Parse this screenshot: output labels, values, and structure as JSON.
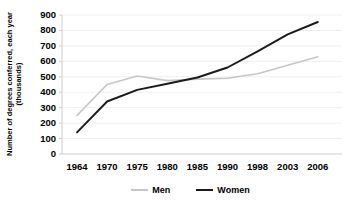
{
  "figure": {
    "width": 349,
    "height": 201,
    "background": "#ffffff"
  },
  "chart_data": {
    "type": "line",
    "title": "",
    "ylabel_line1": "Number of degrees conferred, each year",
    "ylabel_line2": "(thousands)",
    "xlabel": "",
    "categories": [
      "1964",
      "1970",
      "1975",
      "1980",
      "1985",
      "1990",
      "1998",
      "2003",
      "2006"
    ],
    "series": [
      {
        "name": "Men",
        "color": "#c6c6c6",
        "stroke_width": 1.6,
        "values": [
          250,
          450,
          505,
          475,
          485,
          490,
          520,
          575,
          630
        ]
      },
      {
        "name": "Women",
        "color": "#1a1a1a",
        "stroke_width": 1.9,
        "values": [
          140,
          340,
          415,
          455,
          495,
          560,
          665,
          775,
          855
        ]
      }
    ],
    "ylim": [
      0,
      900
    ],
    "yticks": [
      0,
      100,
      200,
      300,
      400,
      500,
      600,
      700,
      800,
      900
    ],
    "grid": "horizontal gridlines, very faint",
    "legend_position": "bottom-center",
    "axis_color": "#cfcfcf",
    "grid_color": "#efefef",
    "text_color": "#000000"
  }
}
